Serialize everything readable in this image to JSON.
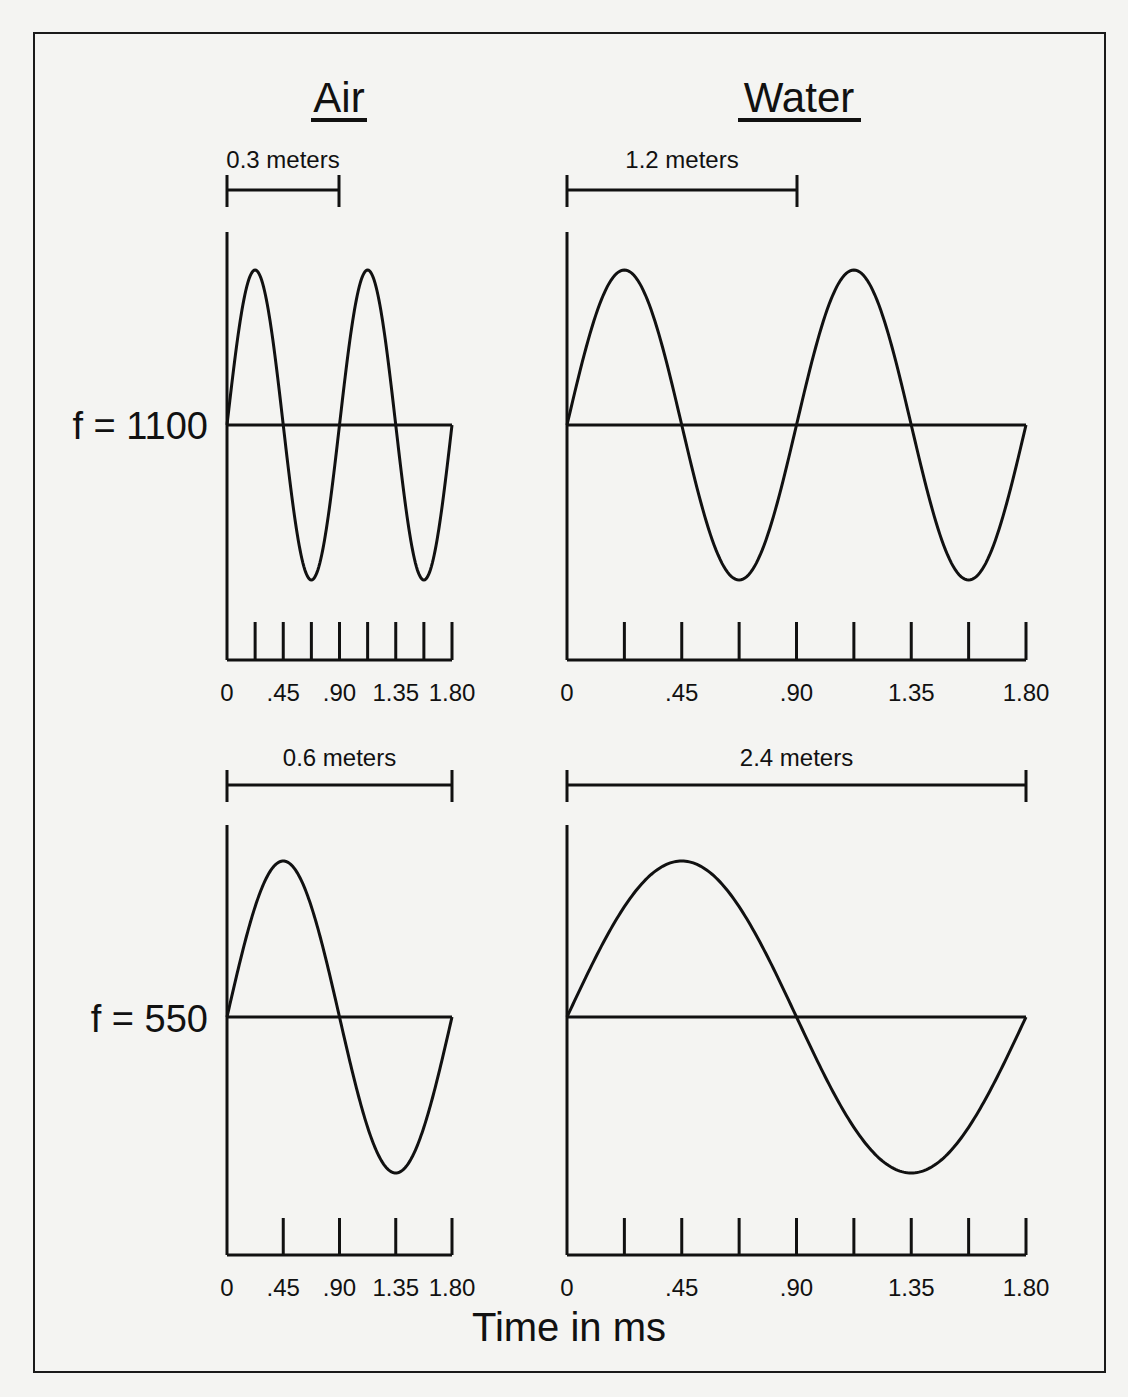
{
  "title_left": "Air",
  "title_right": "Water",
  "row_labels": [
    "f = 1100",
    "f = 550"
  ],
  "x_axis_label": "Time in ms",
  "colors": {
    "background": "#f4f4f2",
    "ink": "#111111"
  },
  "chart_data": [
    {
      "type": "line",
      "medium": "Air",
      "frequency_label": "f = 1100",
      "wavelength_label": "0.3 meters",
      "xlabel": "Time in ms",
      "x_ticks": [
        "0",
        ".45",
        ".90",
        "1.35",
        "1.80"
      ],
      "xlim": [
        0,
        1.8
      ],
      "cycles_shown": 2,
      "tick_marks": 8,
      "series": [
        {
          "name": "sine",
          "function": "sin(2*pi*2*t/1.8)"
        }
      ]
    },
    {
      "type": "line",
      "medium": "Water",
      "frequency_label": "f = 1100",
      "wavelength_label": "1.2 meters",
      "xlabel": "Time in ms",
      "x_ticks": [
        "0",
        ".45",
        ".90",
        "1.35",
        "1.80"
      ],
      "xlim": [
        0,
        1.8
      ],
      "cycles_shown": 2,
      "tick_marks": 8,
      "series": [
        {
          "name": "sine",
          "function": "sin(2*pi*2*t/1.8)"
        }
      ]
    },
    {
      "type": "line",
      "medium": "Air",
      "frequency_label": "f = 550",
      "wavelength_label": "0.6 meters",
      "xlabel": "Time in ms",
      "x_ticks": [
        "0",
        ".45",
        ".90",
        "1.35",
        "1.80"
      ],
      "xlim": [
        0,
        1.8
      ],
      "cycles_shown": 1,
      "tick_marks": 4,
      "series": [
        {
          "name": "sine",
          "function": "sin(2*pi*t/1.8)"
        }
      ]
    },
    {
      "type": "line",
      "medium": "Water",
      "frequency_label": "f = 550",
      "wavelength_label": "2.4 meters",
      "xlabel": "Time in ms",
      "x_ticks": [
        "0",
        ".45",
        ".90",
        "1.35",
        "1.80"
      ],
      "xlim": [
        0,
        1.8
      ],
      "cycles_shown": 1,
      "tick_marks": 8,
      "series": [
        {
          "name": "sine",
          "function": "sin(2*pi*t/1.8)"
        }
      ]
    }
  ],
  "panels": {
    "air_top": {
      "wavelength": "0.3 meters",
      "ticks": [
        "0",
        ".45",
        ".90",
        "1.35",
        "1.80"
      ]
    },
    "water_top": {
      "wavelength": "1.2 meters",
      "ticks": [
        "0",
        ".45",
        ".90",
        "1.35",
        "1.80"
      ]
    },
    "air_bottom": {
      "wavelength": "0.6 meters",
      "ticks": [
        "0",
        ".45",
        ".90",
        "1.35",
        "1.80"
      ]
    },
    "water_bottom": {
      "wavelength": "2.4 meters",
      "ticks": [
        "0",
        ".45",
        ".90",
        "1.35",
        "1.80"
      ]
    }
  }
}
